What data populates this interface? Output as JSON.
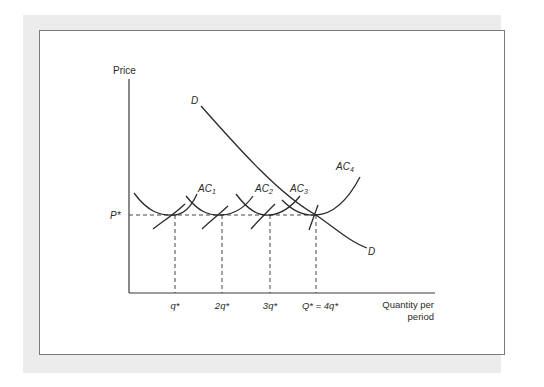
{
  "figure": {
    "y_axis_label": "Price",
    "x_axis_label_line1": "Quantity per",
    "x_axis_label_line2": "period",
    "price_label": "P*",
    "demand_label_top": "D",
    "demand_label_bottom": "D",
    "cost_curves": [
      {
        "label": "AC",
        "sub": "1"
      },
      {
        "label": "AC",
        "sub": "2"
      },
      {
        "label": "AC",
        "sub": "3"
      },
      {
        "label": "AC",
        "sub": "4"
      }
    ],
    "x_ticks": [
      "q*",
      "2q*",
      "3q*",
      "Q* = 4q*"
    ]
  },
  "colors": {
    "frame_background": "#ececec",
    "panel_background": "#ffffff",
    "panel_border": "#7a7a7a",
    "ink": "#2a2a2a"
  }
}
